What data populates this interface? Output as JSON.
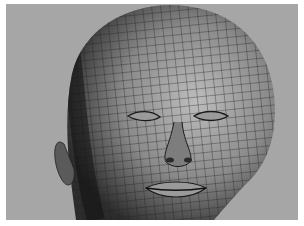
{
  "image": {
    "subject": "3D wireframe polygon mesh of a human head, front three-quarter view, eyes closed",
    "background_color": "#a6a6a6",
    "border_color": "#ffffff",
    "mesh_light": "#b0b0b0",
    "mesh_dark": "#2a2a2a",
    "wire_color": "#1e1e1e"
  }
}
